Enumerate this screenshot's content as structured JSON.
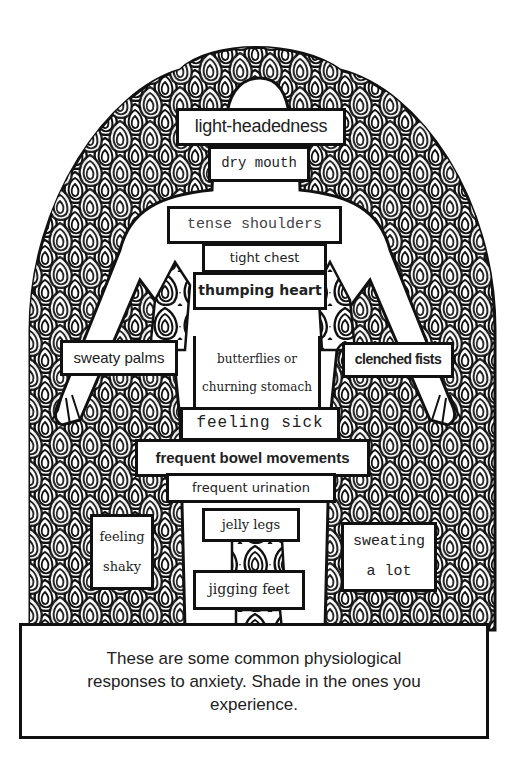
{
  "worksheet": {
    "figure": "body-outline-with-swirl-pattern",
    "labels": [
      {
        "id": "light-headedness",
        "text": "light-headedness"
      },
      {
        "id": "dry-mouth",
        "text": "dry mouth"
      },
      {
        "id": "tense-shoulders",
        "text": "tense shoulders"
      },
      {
        "id": "tight-chest",
        "text": "tight chest"
      },
      {
        "id": "thumping-heart",
        "text": "thumping heart"
      },
      {
        "id": "sweaty-palms",
        "text": "sweaty palms"
      },
      {
        "id": "butterflies",
        "lines": [
          "butterflies or",
          "churning stomach"
        ]
      },
      {
        "id": "clenched-fists",
        "text": "clenched fists"
      },
      {
        "id": "feeling-sick",
        "text": "feeling sick"
      },
      {
        "id": "frequent-bowel",
        "text": "frequent bowel movements"
      },
      {
        "id": "frequent-urination",
        "text": "frequent urination"
      },
      {
        "id": "feeling-shaky",
        "lines": [
          "feeling",
          "shaky"
        ]
      },
      {
        "id": "jelly-legs",
        "text": "jelly legs"
      },
      {
        "id": "sweating-a-lot",
        "lines": [
          "sweating",
          "a lot"
        ]
      },
      {
        "id": "jigging-feet",
        "text": "jigging feet"
      }
    ],
    "caption": "These are some common physiological responses to anxiety. Shade in the ones you experience.",
    "colors": {
      "ink": "#111111",
      "paper": "#ffffff",
      "text": "#222222"
    }
  }
}
